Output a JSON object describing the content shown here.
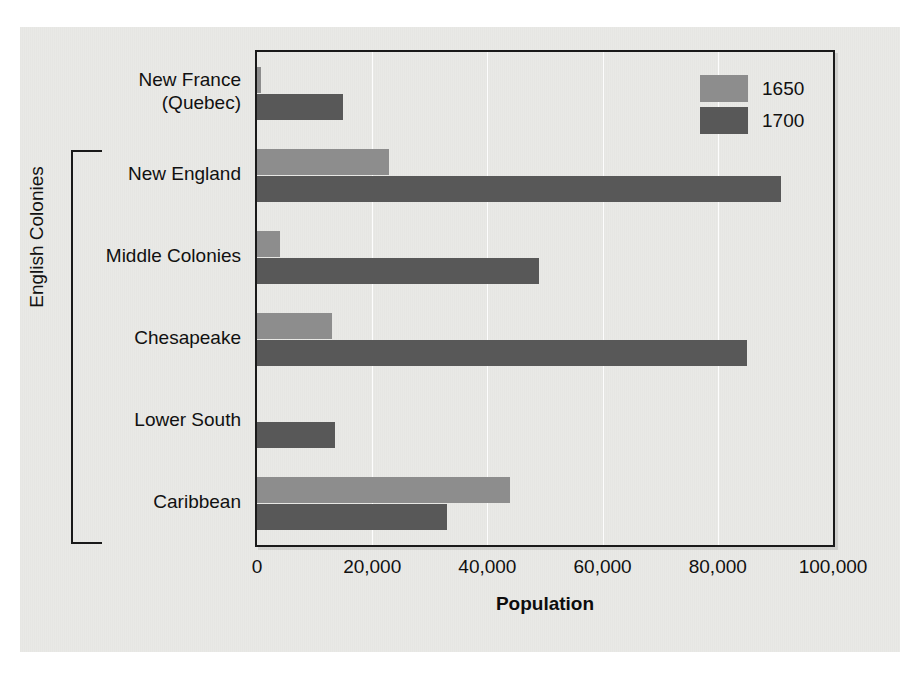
{
  "chart_data": {
    "type": "bar",
    "orientation": "horizontal",
    "title": "",
    "xlabel": "Population",
    "ylabel": "",
    "categories": [
      "New France (Quebec)",
      "New England",
      "Middle Colonies",
      "Chesapeake",
      "Lower South",
      "Caribbean"
    ],
    "category_lines": [
      [
        "New France",
        "(Quebec)"
      ],
      [
        "New England"
      ],
      [
        "Middle Colonies"
      ],
      [
        "Chesapeake"
      ],
      [
        "Lower South"
      ],
      [
        "Caribbean"
      ]
    ],
    "series": [
      {
        "name": "1650",
        "color": "#8d8d8d",
        "values": [
          700,
          23000,
          4000,
          13000,
          0,
          44000
        ]
      },
      {
        "name": "1700",
        "color": "#585858",
        "values": [
          15000,
          91000,
          49000,
          85000,
          13500,
          33000
        ]
      }
    ],
    "xlim": [
      0,
      100000
    ],
    "xticks": [
      0,
      20000,
      40000,
      60000,
      80000,
      100000
    ],
    "xtick_labels": [
      "0",
      "20,000",
      "40,000",
      "60,000",
      "80,000",
      "100,000"
    ],
    "grid": "vertical",
    "legend_position": "top-right",
    "group_bracket": {
      "label": "English Colonies",
      "from_category": "New England",
      "to_category": "Caribbean"
    }
  },
  "legend": {
    "entries": [
      {
        "label": "1650",
        "color": "#8d8d8d"
      },
      {
        "label": "1700",
        "color": "#585858"
      }
    ]
  },
  "axis": {
    "x_title": "Population",
    "tick_labels": [
      "0",
      "20,000",
      "40,000",
      "60,000",
      "80,000",
      "100,000"
    ]
  },
  "annotations": {
    "bracket_label": "English Colonies"
  },
  "colors": {
    "series_1650": "#8d8d8d",
    "series_1700": "#585858",
    "page_background": "#e9e9e6",
    "frame": "#1a1a1a",
    "text": "#111111"
  }
}
